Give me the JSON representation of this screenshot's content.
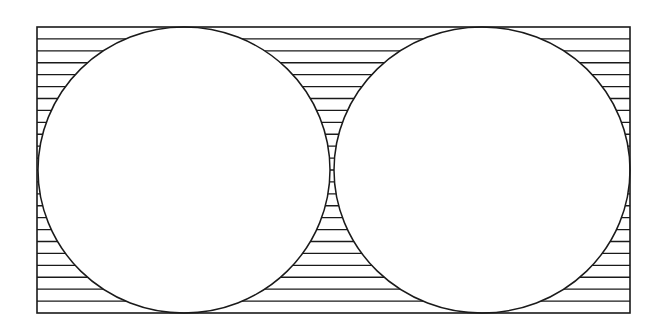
{
  "diagram": {
    "stroke_color": "#1a1a1a",
    "fill_color": "#ffffff",
    "rectangle": {
      "x": 37,
      "y": 27,
      "width": 593,
      "height": 286
    },
    "circles": [
      {
        "name": "left-circle",
        "cx": 184,
        "cy": 170,
        "rx": 146,
        "ry": 143
      },
      {
        "name": "right-circle",
        "cx": 482,
        "cy": 170,
        "rx": 148,
        "ry": 143
      }
    ],
    "hatch": {
      "orientation": "horizontal",
      "count": 24
    }
  }
}
